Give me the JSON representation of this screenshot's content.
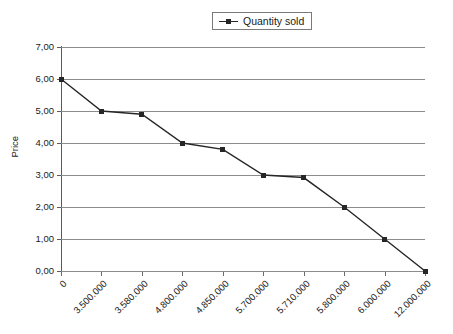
{
  "legend": {
    "position": "top-center",
    "entries": [
      {
        "label": "Quantity sold",
        "marker": "square-line-marker",
        "color": "#262626"
      }
    ]
  },
  "axes": {
    "ylabel": "Price",
    "xlabel": "",
    "ytick_labels": [
      "7,00",
      "6,00",
      "5,00",
      "4,00",
      "3,00",
      "2,00",
      "1,00",
      "0,00"
    ],
    "xtick_labels": [
      "0",
      "3.500.000",
      "3.580.000",
      "4.800.000",
      "4.850.000",
      "5.700.000",
      "5.710.000",
      "5.800.000",
      "6.000.000",
      "12.000.000"
    ]
  },
  "style": {
    "background": "#ffffff",
    "gridline_color": "#8c8c8c",
    "axis_color": "#5a5a5a",
    "series_color": "#262626"
  },
  "chart_data": {
    "type": "line",
    "title": "",
    "xlabel": "",
    "ylabel": "Price",
    "grid": true,
    "legend_position": "top-center",
    "categories": [
      "0",
      "3.500.000",
      "3.580.000",
      "4.800.000",
      "4.850.000",
      "5.700.000",
      "5.710.000",
      "5.800.000",
      "6.000.000",
      "12.000.000"
    ],
    "ylim": [
      0,
      7
    ],
    "ytick_values": [
      0,
      1,
      2,
      3,
      4,
      5,
      6,
      7
    ],
    "decimal_separator": ",",
    "thousands_separator": ".",
    "series": [
      {
        "name": "Quantity sold",
        "color": "#262626",
        "marker": "square",
        "values": [
          6.0,
          5.0,
          4.9,
          4.0,
          3.8,
          3.0,
          2.92,
          2.0,
          1.0,
          0.0
        ]
      }
    ]
  }
}
